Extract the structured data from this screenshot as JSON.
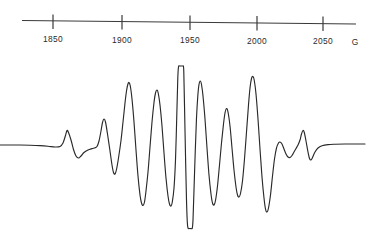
{
  "figure": {
    "title": "",
    "background_color": "#ffffff",
    "trace_color": "#2a2a2a",
    "axis_color": "#3a3a3a"
  },
  "axis": {
    "name": "magnetic-field-axis",
    "unit_label": "G",
    "unit_name": "gauss",
    "tick_labels": [
      "1850",
      "1900",
      "1950",
      "2000",
      "2050"
    ],
    "tick_values": [
      1850,
      1900,
      1950,
      2000,
      2050
    ],
    "tick_x_px": [
      53,
      122,
      190,
      257,
      323
    ],
    "axis_start_px": 22,
    "axis_end_px": 356,
    "axis_y_px": 22,
    "tick_top_px": 15,
    "tick_bottom_px": 29,
    "label_y_px": 40
  },
  "chart_data": {
    "type": "line",
    "title": "",
    "subtitle": "",
    "xlabel": "G",
    "ylabel": "",
    "grid": false,
    "legend": "none",
    "xlim": [
      1814,
      2074
    ],
    "ylim": [
      -1.25,
      1.25
    ],
    "x_tick_labels": [
      "1850",
      "1900",
      "1950",
      "2000",
      "2050"
    ],
    "x_ticks": [
      1850,
      1900,
      1950,
      2000,
      2050
    ],
    "annotations": [
      "central line clipped flat at top and bottom",
      "symmetric derivative multiplet with small outer satellites"
    ],
    "series": [
      {
        "name": "epr-derivative-trace",
        "description": "first-derivative EPR absorption signal",
        "peaks_gauss": [
          1883,
          1910,
          1927,
          1944,
          1958,
          1967,
          1977,
          1991,
          2007,
          2043
        ],
        "troughs_gauss": [
          1890,
          1917,
          1934,
          1950,
          1962,
          1972,
          1984,
          1999,
          2015,
          2050
        ],
        "points": [
          [
            0,
            145
          ],
          [
            10,
            145
          ],
          [
            20,
            145
          ],
          [
            30,
            145.2
          ],
          [
            40,
            145.6
          ],
          [
            48,
            146.2
          ],
          [
            55,
            147.0
          ],
          [
            60,
            146.5
          ],
          [
            63,
            143.0
          ],
          [
            65.5,
            135.5
          ],
          [
            67,
            130.5
          ],
          [
            68.5,
            132.5
          ],
          [
            71,
            140.0
          ],
          [
            73.5,
            149.5
          ],
          [
            76,
            156.0
          ],
          [
            78.5,
            158.0
          ],
          [
            81,
            156.0
          ],
          [
            84,
            152.5
          ],
          [
            88,
            150.0
          ],
          [
            92,
            148.6
          ],
          [
            95,
            147.8
          ],
          [
            97,
            146.5
          ],
          [
            99,
            141.0
          ],
          [
            101,
            131.0
          ],
          [
            102.5,
            122.5
          ],
          [
            104,
            119.0
          ],
          [
            105.5,
            122.0
          ],
          [
            107.5,
            134.0
          ],
          [
            110,
            151.0
          ],
          [
            112,
            165.0
          ],
          [
            113.5,
            172.5
          ],
          [
            115,
            174.0
          ],
          [
            116.5,
            169.5
          ],
          [
            118.5,
            158.0
          ],
          [
            121,
            140.5
          ],
          [
            123,
            122.0
          ],
          [
            125,
            103.0
          ],
          [
            126.5,
            91.0
          ],
          [
            127.8,
            84.5
          ],
          [
            129,
            82.5
          ],
          [
            130.3,
            86.0
          ],
          [
            132,
            99.0
          ],
          [
            134,
            122.0
          ],
          [
            136,
            150.0
          ],
          [
            138,
            176.0
          ],
          [
            140,
            195.0
          ],
          [
            141.5,
            203.0
          ],
          [
            143,
            205.5
          ],
          [
            144.5,
            202.0
          ],
          [
            146,
            191.0
          ],
          [
            148,
            172.0
          ],
          [
            150,
            147.0
          ],
          [
            152,
            122.0
          ],
          [
            154,
            102.5
          ],
          [
            155.5,
            93.0
          ],
          [
            157,
            90.0
          ],
          [
            158.3,
            93.5
          ],
          [
            160,
            105.0
          ],
          [
            162,
            126.0
          ],
          [
            164,
            153.0
          ],
          [
            166,
            178.0
          ],
          [
            168,
            196.0
          ],
          [
            169.5,
            204.0
          ],
          [
            171,
            206.0
          ],
          [
            172.3,
            202.0
          ],
          [
            174,
            188.0
          ],
          [
            175.5,
            160.0
          ],
          [
            176.8,
            115.0
          ],
          [
            177.8,
            78.0
          ],
          [
            178.5,
            67.0
          ],
          [
            179.5,
            66.0
          ],
          [
            181,
            66.0
          ],
          [
            182.5,
            66.0
          ],
          [
            183.3,
            66.2
          ],
          [
            183.8,
            72.0
          ],
          [
            184.5,
            105.0
          ],
          [
            185.5,
            155.0
          ],
          [
            186.5,
            200.0
          ],
          [
            187.3,
            222.0
          ],
          [
            188,
            228.0
          ],
          [
            189.5,
            228.5
          ],
          [
            191,
            228.5
          ],
          [
            192.3,
            228.0
          ],
          [
            193,
            220.0
          ],
          [
            194,
            190.0
          ],
          [
            195.3,
            150.0
          ],
          [
            196.5,
            118.0
          ],
          [
            197.8,
            96.0
          ],
          [
            199,
            84.5
          ],
          [
            200.3,
            81.0
          ],
          [
            201.5,
            84.5
          ],
          [
            203,
            96.0
          ],
          [
            205,
            119.0
          ],
          [
            207,
            148.0
          ],
          [
            209,
            175.0
          ],
          [
            211,
            194.0
          ],
          [
            212.5,
            203.0
          ],
          [
            214,
            205.0
          ],
          [
            215.5,
            200.5
          ],
          [
            217.5,
            186.0
          ],
          [
            219.5,
            165.0
          ],
          [
            221.5,
            143.0
          ],
          [
            223.5,
            124.0
          ],
          [
            225,
            113.0
          ],
          [
            226.5,
            108.5
          ],
          [
            228,
            112.0
          ],
          [
            230,
            126.0
          ],
          [
            232,
            148.0
          ],
          [
            234,
            170.0
          ],
          [
            236,
            187.0
          ],
          [
            237.5,
            195.0
          ],
          [
            239,
            197.0
          ],
          [
            240.5,
            193.5
          ],
          [
            242.5,
            181.0
          ],
          [
            244.5,
            159.0
          ],
          [
            246.5,
            132.0
          ],
          [
            248.5,
            105.0
          ],
          [
            250,
            88.0
          ],
          [
            251.5,
            78.5
          ],
          [
            253,
            76.5
          ],
          [
            254.3,
            80.5
          ],
          [
            256,
            94.0
          ],
          [
            258,
            119.0
          ],
          [
            260,
            149.0
          ],
          [
            262,
            177.0
          ],
          [
            264,
            198.0
          ],
          [
            265.5,
            209.0
          ],
          [
            267,
            212.0
          ],
          [
            268.5,
            208.0
          ],
          [
            270.5,
            195.0
          ],
          [
            272.5,
            176.0
          ],
          [
            274.5,
            159.0
          ],
          [
            276.5,
            148.0
          ],
          [
            278.5,
            143.0
          ],
          [
            280,
            142.0
          ],
          [
            282,
            144.0
          ],
          [
            284,
            149.0
          ],
          [
            286,
            154.0
          ],
          [
            288,
            157.0
          ],
          [
            290,
            157.5
          ],
          [
            292,
            155.5
          ],
          [
            294,
            152.0
          ],
          [
            296,
            148.5
          ],
          [
            298,
            145.0
          ],
          [
            300,
            140.0
          ],
          [
            301.5,
            134.0
          ],
          [
            303,
            130.5
          ],
          [
            304.3,
            132.5
          ],
          [
            306,
            141.0
          ],
          [
            308,
            152.0
          ],
          [
            309.5,
            158.5
          ],
          [
            311,
            160.0
          ],
          [
            312.5,
            157.5
          ],
          [
            315,
            152.0
          ],
          [
            318,
            148.0
          ],
          [
            322,
            145.8
          ],
          [
            328,
            144.6
          ],
          [
            335,
            144.2
          ],
          [
            345,
            144.0
          ],
          [
            355,
            144.0
          ],
          [
            365,
            144.0
          ]
        ]
      }
    ]
  }
}
